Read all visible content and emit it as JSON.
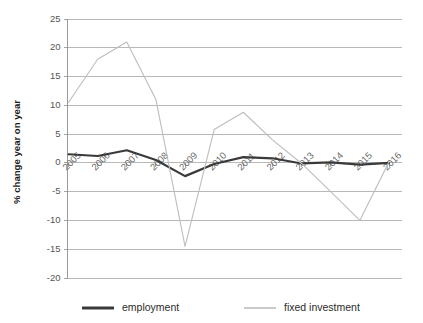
{
  "chart_data": {
    "type": "line",
    "title": "",
    "xlabel": "",
    "ylabel": "% change year on year",
    "categories": [
      "2005",
      "2006",
      "2007",
      "2008",
      "2009",
      "2010",
      "2011",
      "2012",
      "2013",
      "2014",
      "2015",
      "2016"
    ],
    "x": [
      2005,
      2006,
      2007,
      2008,
      2009,
      2010,
      2011,
      2012,
      2013,
      2014,
      2015,
      2016
    ],
    "series": [
      {
        "name": "employment",
        "color": "#3a3a3a",
        "values": [
          1.5,
          1.2,
          2.2,
          0.5,
          -2.3,
          -0.2,
          1.0,
          0.8,
          -0.1,
          0.1,
          -0.3,
          0.0
        ]
      },
      {
        "name": "fixed investment",
        "color": "#bdbdbd",
        "values": [
          10.5,
          18.0,
          21.0,
          11.0,
          -14.5,
          5.8,
          8.8,
          4.0,
          -0.1,
          -5.0,
          -10.0,
          0.2
        ]
      }
    ],
    "ylim": [
      -20,
      25
    ],
    "yticks": [
      25,
      20,
      15,
      10,
      5,
      0,
      -5,
      -10,
      -15,
      -20
    ],
    "ytick_labels": [
      "25",
      "20",
      "15",
      "10",
      "5",
      "0",
      "-5",
      "-10",
      "-15",
      "-20"
    ],
    "grid": true,
    "grid_axis": "y",
    "legend_position": "bottom",
    "legend": [
      "employment",
      "fixed investment"
    ],
    "xtick_rotation": 45
  },
  "axis": {
    "y_title": "% change year on year"
  },
  "legend": {
    "items": [
      {
        "label": "employment",
        "color": "#3a3a3a"
      },
      {
        "label": "fixed investment",
        "color": "#bdbdbd"
      }
    ]
  },
  "colors": {
    "employment": "#3a3a3a",
    "fixed_investment": "#bdbdbd",
    "grid": "#9a9a9a",
    "axis": "#8f8f8f",
    "background": "#ffffff"
  }
}
